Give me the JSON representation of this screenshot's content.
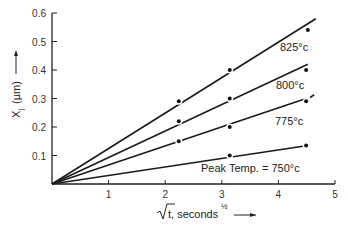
{
  "chart_data": {
    "type": "line",
    "title": "",
    "xlabel": "√t, seconds^½",
    "ylabel": "Xj (µm)",
    "xlim": [
      0,
      5
    ],
    "ylim": [
      0,
      0.6
    ],
    "x_ticks": [
      "1",
      "2",
      "3",
      "4",
      "5"
    ],
    "y_ticks": [
      "0.1",
      "0.2",
      "0.3",
      "0.4",
      "0.5",
      "0.6"
    ],
    "grid": false,
    "series": [
      {
        "name": "825°c",
        "line": [
          [
            0,
            0
          ],
          [
            4.66,
            0.58
          ]
        ],
        "points": [
          [
            2.24,
            0.29
          ],
          [
            3.14,
            0.4
          ],
          [
            4.52,
            0.54
          ]
        ]
      },
      {
        "name": "800°c",
        "line": [
          [
            0,
            0
          ],
          [
            4.52,
            0.42
          ]
        ],
        "points": [
          [
            2.24,
            0.22
          ],
          [
            3.14,
            0.3
          ],
          [
            4.49,
            0.4
          ]
        ]
      },
      {
        "name": "775°c",
        "line": [
          [
            0,
            0
          ],
          [
            4.49,
            0.3
          ]
        ],
        "dash_ext": [
          [
            4.49,
            0.3
          ],
          [
            4.68,
            0.32
          ]
        ],
        "points": [
          [
            2.24,
            0.15
          ],
          [
            3.14,
            0.2
          ],
          [
            4.49,
            0.29
          ]
        ]
      },
      {
        "name": "Peak Temp. = 750°c",
        "line": [
          [
            0,
            0
          ],
          [
            4.52,
            0.135
          ]
        ],
        "points": [
          [
            3.14,
            0.1
          ],
          [
            4.49,
            0.135
          ]
        ]
      }
    ],
    "labels": {
      "s825": "825°c",
      "s800": "800°c",
      "s775": "775°c",
      "s750": "Peak Temp. = 750°c",
      "x_main": "t, seconds",
      "x_sup": "½",
      "y_main": "X",
      "y_sub": "j",
      "y_unit": "(µm)"
    }
  }
}
